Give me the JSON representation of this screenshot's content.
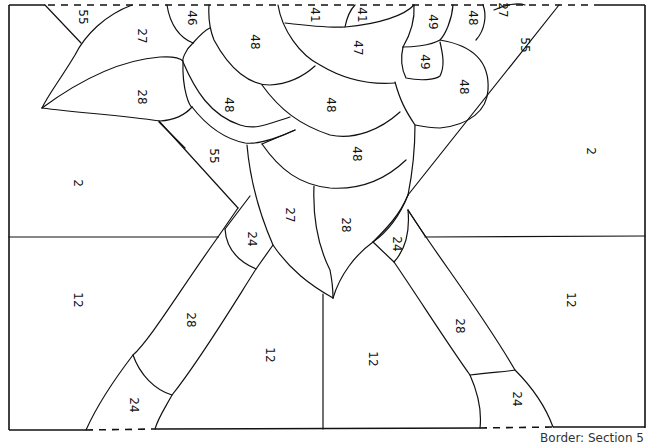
{
  "caption": "Border: Section 5",
  "region_labels": [
    {
      "text": "55",
      "x": 82,
      "y": 17,
      "rot": 90
    },
    {
      "text": "27",
      "x": 141,
      "y": 36,
      "rot": 90
    },
    {
      "text": "46",
      "x": 191,
      "y": 18,
      "rot": 90
    },
    {
      "text": "41",
      "x": 314,
      "y": 15,
      "rot": 90
    },
    {
      "text": "41",
      "x": 361,
      "y": 15,
      "rot": 90
    },
    {
      "text": "49",
      "x": 432,
      "y": 22,
      "rot": 90
    },
    {
      "text": "48",
      "x": 472,
      "y": 18,
      "rot": 90
    },
    {
      "text": "27",
      "x": 502,
      "y": 10,
      "rot": 90
    },
    {
      "text": "48",
      "x": 254,
      "y": 42,
      "rot": 90
    },
    {
      "text": "47",
      "x": 357,
      "y": 48,
      "rot": 90
    },
    {
      "text": "49",
      "x": 424,
      "y": 62,
      "rot": 90
    },
    {
      "text": "55",
      "x": 524,
      "y": 45,
      "rot": 90
    },
    {
      "text": "48",
      "x": 463,
      "y": 87,
      "rot": 90
    },
    {
      "text": "28",
      "x": 141,
      "y": 97,
      "rot": 90
    },
    {
      "text": "48",
      "x": 228,
      "y": 105,
      "rot": 90
    },
    {
      "text": "48",
      "x": 330,
      "y": 105,
      "rot": 90
    },
    {
      "text": "55",
      "x": 213,
      "y": 156,
      "rot": 90
    },
    {
      "text": "48",
      "x": 356,
      "y": 154,
      "rot": 90
    },
    {
      "text": "2",
      "x": 77,
      "y": 183,
      "rot": 90
    },
    {
      "text": "2",
      "x": 590,
      "y": 151,
      "rot": 90
    },
    {
      "text": "27",
      "x": 289,
      "y": 215,
      "rot": 90
    },
    {
      "text": "28",
      "x": 345,
      "y": 225,
      "rot": 90
    },
    {
      "text": "24",
      "x": 251,
      "y": 239,
      "rot": 90
    },
    {
      "text": "24",
      "x": 396,
      "y": 244,
      "rot": 90
    },
    {
      "text": "12",
      "x": 77,
      "y": 300,
      "rot": 90
    },
    {
      "text": "12",
      "x": 570,
      "y": 300,
      "rot": 90
    },
    {
      "text": "28",
      "x": 190,
      "y": 320,
      "rot": 90
    },
    {
      "text": "28",
      "x": 459,
      "y": 326,
      "rot": 90
    },
    {
      "text": "12",
      "x": 269,
      "y": 355,
      "rot": 90
    },
    {
      "text": "12",
      "x": 372,
      "y": 359,
      "rot": 90
    },
    {
      "text": "24",
      "x": 133,
      "y": 405,
      "rot": 90
    },
    {
      "text": "24",
      "x": 516,
      "y": 399,
      "rot": 90
    }
  ]
}
